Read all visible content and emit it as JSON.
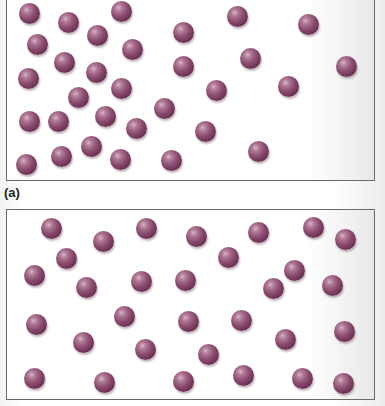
{
  "figure": {
    "particle_color": "#8c4c70",
    "particle_radius_px": 10
  },
  "panels": [
    {
      "id": "a",
      "label": "(a)",
      "particles": [
        [
          29,
          13
        ],
        [
          68,
          22
        ],
        [
          121,
          11
        ],
        [
          37,
          44
        ],
        [
          97,
          35
        ],
        [
          64,
          62
        ],
        [
          28,
          78
        ],
        [
          96,
          72
        ],
        [
          132,
          49
        ],
        [
          183,
          32
        ],
        [
          237,
          16
        ],
        [
          308,
          24
        ],
        [
          183,
          66
        ],
        [
          250,
          58
        ],
        [
          346,
          66
        ],
        [
          121,
          88
        ],
        [
          78,
          97
        ],
        [
          29,
          121
        ],
        [
          58,
          121
        ],
        [
          105,
          116
        ],
        [
          136,
          128
        ],
        [
          164,
          108
        ],
        [
          91,
          146
        ],
        [
          61,
          156
        ],
        [
          26,
          164
        ],
        [
          120,
          159
        ],
        [
          171,
          160
        ],
        [
          216,
          90
        ],
        [
          288,
          86
        ],
        [
          205,
          131
        ],
        [
          258,
          151
        ]
      ]
    },
    {
      "id": "b",
      "label": "",
      "particles": [
        [
          51,
          228
        ],
        [
          103,
          241
        ],
        [
          66,
          258
        ],
        [
          34,
          275
        ],
        [
          86,
          287
        ],
        [
          146,
          228
        ],
        [
          141,
          281
        ],
        [
          196,
          236
        ],
        [
          258,
          232
        ],
        [
          313,
          227
        ],
        [
          345,
          239
        ],
        [
          228,
          257
        ],
        [
          294,
          270
        ],
        [
          185,
          280
        ],
        [
          273,
          288
        ],
        [
          332,
          285
        ],
        [
          36,
          324
        ],
        [
          124,
          316
        ],
        [
          83,
          342
        ],
        [
          145,
          349
        ],
        [
          34,
          378
        ],
        [
          104,
          382
        ],
        [
          188,
          321
        ],
        [
          241,
          320
        ],
        [
          285,
          339
        ],
        [
          344,
          331
        ],
        [
          208,
          354
        ],
        [
          183,
          381
        ],
        [
          243,
          375
        ],
        [
          302,
          378
        ],
        [
          343,
          383
        ]
      ]
    }
  ]
}
